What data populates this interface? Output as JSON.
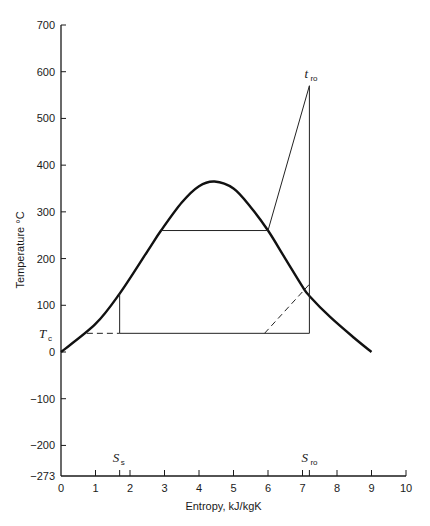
{
  "chart_data": {
    "type": "line",
    "title": "",
    "xlabel": "Entropy, kJ/kgK",
    "ylabel": "Temperature °C",
    "xlim": [
      0,
      10
    ],
    "ylim": [
      -273,
      700
    ],
    "x_ticks": [
      "0",
      "1",
      "2",
      "3",
      "4",
      "5",
      "6",
      "7",
      "8",
      "9",
      "10"
    ],
    "y_ticks": [
      "700",
      "600",
      "500",
      "400",
      "300",
      "200",
      "100",
      "0",
      "-100",
      "-200",
      "-273"
    ],
    "annotations": {
      "Tc": {
        "label": "T",
        "sub": "c",
        "value": 40
      },
      "tro": {
        "label": "t",
        "sub": "ro",
        "value": 570
      },
      "Ss": {
        "label": "S",
        "sub": "s",
        "value": 1.7
      },
      "Sro": {
        "label": "S",
        "sub": "ro",
        "value": 7.2
      }
    },
    "series": [
      {
        "name": "saturation dome",
        "style": "thick",
        "x": [
          0,
          1.0,
          1.7,
          2.5,
          2.9,
          3.5,
          4.0,
          4.45,
          5.0,
          5.5,
          6.0,
          6.5,
          7.0,
          7.2,
          7.8,
          8.5,
          9.0
        ],
        "y": [
          0,
          60,
          125,
          215,
          260,
          320,
          355,
          365,
          350,
          310,
          260,
          200,
          140,
          120,
          75,
          30,
          0
        ]
      },
      {
        "name": "cycle",
        "style": "thin",
        "segments": [
          {
            "x": [
              1.7,
              1.7
            ],
            "y": [
              40,
              125
            ]
          },
          {
            "x": [
              2.9,
              6.0
            ],
            "y": [
              260,
              260
            ]
          },
          {
            "x": [
              6.0,
              7.2
            ],
            "y": [
              260,
              570
            ]
          },
          {
            "x": [
              7.2,
              7.2
            ],
            "y": [
              570,
              40
            ]
          },
          {
            "x": [
              1.7,
              7.2
            ],
            "y": [
              40,
              40
            ]
          }
        ]
      },
      {
        "name": "dashed",
        "style": "dashed",
        "segments": [
          {
            "x": [
              0.75,
              1.7
            ],
            "y": [
              40,
              40
            ]
          },
          {
            "x": [
              5.9,
              7.2
            ],
            "y": [
              40,
              145
            ]
          }
        ]
      }
    ]
  }
}
